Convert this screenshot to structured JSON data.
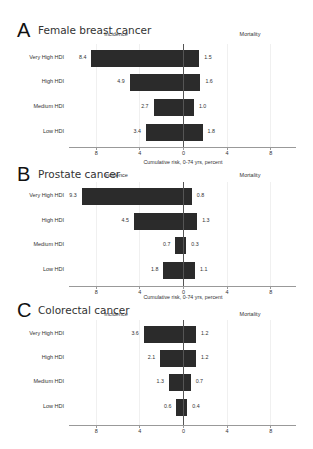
{
  "chart_data": [
    {
      "type": "bar",
      "orientation": "horizontal-diverging",
      "panel": "A",
      "title": "Female breast cancer",
      "left_header": "Incidence",
      "right_header": "Mortality",
      "categories": [
        "Very High HDI",
        "High HDI",
        "Medium HDI",
        "Low HDI"
      ],
      "series": [
        {
          "name": "Incidence",
          "direction": "left",
          "values": [
            8.4,
            4.9,
            2.7,
            3.4
          ],
          "labels": [
            "8.4",
            "4.9",
            "2.7",
            "3.4"
          ]
        },
        {
          "name": "Mortality",
          "direction": "right",
          "values": [
            1.5,
            1.6,
            1.0,
            1.8
          ],
          "labels": [
            "1.5",
            "1.6",
            "1.0",
            "1.8"
          ]
        }
      ],
      "xticks": [
        "8",
        "4",
        "0",
        "4",
        "8"
      ],
      "xlabel": "Cumulative risk, 0-74 yrs, percent",
      "xlim": [
        -10,
        10.5
      ],
      "grid": true
    },
    {
      "type": "bar",
      "orientation": "horizontal-diverging",
      "panel": "B",
      "title": "Prostate cancer",
      "left_header": "Incidence",
      "right_header": "Mortality",
      "categories": [
        "Very High HDI",
        "High HDI",
        "Medium HDI",
        "Low HDI"
      ],
      "series": [
        {
          "name": "Incidence",
          "direction": "left",
          "values": [
            9.3,
            4.5,
            0.7,
            1.8
          ],
          "labels": [
            "9.3",
            "4.5",
            "0.7",
            "1.8"
          ]
        },
        {
          "name": "Mortality",
          "direction": "right",
          "values": [
            0.8,
            1.3,
            0.3,
            1.1
          ],
          "labels": [
            "0.8",
            "1.3",
            "0.3",
            "1.1"
          ]
        }
      ],
      "xticks": [
        "8",
        "4",
        "0",
        "4",
        "8"
      ],
      "xlabel": "Cumulative risk, 0-74 yrs, percent",
      "xlim": [
        -10,
        10.5
      ],
      "grid": true
    },
    {
      "type": "bar",
      "orientation": "horizontal-diverging",
      "panel": "C",
      "title": "Colorectal cancer",
      "left_header": "Incidence",
      "right_header": "Mortality",
      "categories": [
        "Very High HDI",
        "High HDI",
        "Medium HDI",
        "Low HDI"
      ],
      "series": [
        {
          "name": "Incidence",
          "direction": "left",
          "values": [
            3.6,
            2.1,
            1.3,
            0.6
          ],
          "labels": [
            "3.6",
            "2.1",
            "1.3",
            "0.6"
          ]
        },
        {
          "name": "Mortality",
          "direction": "right",
          "values": [
            1.2,
            1.2,
            0.7,
            0.4
          ],
          "labels": [
            "1.2",
            "1.2",
            "0.7",
            "0.4"
          ]
        }
      ],
      "xticks": [
        "8",
        "4",
        "0",
        "4",
        "8"
      ],
      "xlabel": "",
      "xlim": [
        -10,
        10.5
      ],
      "grid": true
    }
  ],
  "panels": [
    {
      "letter": "A",
      "title": "Female breast cancer",
      "xlabel": "Cumulative risk, 0-74 yrs, percent"
    },
    {
      "letter": "B",
      "title": "Prostate cancer",
      "xlabel": "Cumulative risk, 0-74 yrs, percent"
    },
    {
      "letter": "C",
      "title": "Colorectal cancer",
      "xlabel": ""
    }
  ],
  "colors": {
    "bar": "#2b2b2b",
    "axis": "#999999",
    "zero_line": "#555555",
    "grid": "#f0f0f0"
  }
}
